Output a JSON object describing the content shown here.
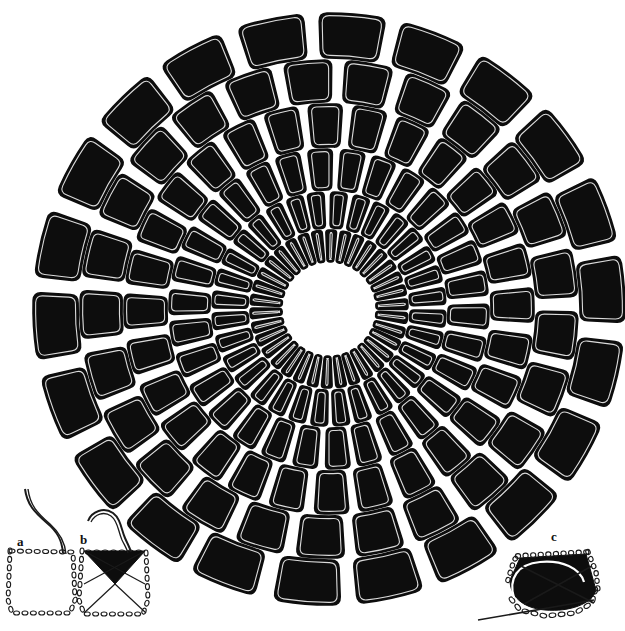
{
  "figure": {
    "kind": "scientific-plate",
    "caption_labels": [
      "a",
      "b",
      "c"
    ],
    "background_color": "#ffffff",
    "ink_color": "#0d0d0d",
    "outline_color": "#1a1a1a"
  },
  "comb": {
    "name": "radial-spiral-comb",
    "center_x": 329,
    "center_y": 309,
    "outer_radius": 296,
    "hub_radius": 46,
    "hub_color": "#ffffff",
    "cell_fill": "#0d0d0d",
    "cell_stroke": "#ffffff",
    "spiral_twist_deg": 26,
    "rings": [
      {
        "index": 0,
        "inner_r": 47,
        "outer_r": 79,
        "count": 34,
        "corner": 3,
        "gap_deg": 2.6,
        "phase_deg": 0
      },
      {
        "index": 1,
        "inner_r": 81,
        "outer_r": 117,
        "count": 32,
        "corner": 4,
        "gap_deg": 2.8,
        "phase_deg": 5
      },
      {
        "index": 2,
        "inner_r": 119,
        "outer_r": 160,
        "count": 30,
        "corner": 5,
        "gap_deg": 3.0,
        "phase_deg": 11
      },
      {
        "index": 3,
        "inner_r": 162,
        "outer_r": 205,
        "count": 28,
        "corner": 6,
        "gap_deg": 3.1,
        "phase_deg": 17
      },
      {
        "index": 4,
        "inner_r": 207,
        "outer_r": 249,
        "count": 25,
        "corner": 7,
        "gap_deg": 3.2,
        "phase_deg": 23
      },
      {
        "index": 5,
        "inner_r": 251,
        "outer_r": 296,
        "count": 22,
        "corner": 8,
        "gap_deg": 3.3,
        "phase_deg": 30
      }
    ]
  },
  "insets": [
    {
      "id": "a",
      "label": "a",
      "label_x": 17,
      "label_y": 546,
      "description": "empty cell outline in beaded dotted line with a single curved fibre drawn down from above",
      "outline_style": "beaded-dotted",
      "has_fill": false,
      "has_cross_lines": false
    },
    {
      "id": "b",
      "label": "b",
      "label_x": 80,
      "label_y": 544,
      "description": "cell outline in beaded dotted line with solid filled inverted triangle at top and two crossing guide lines",
      "outline_style": "beaded-dotted",
      "has_fill": true,
      "has_cross_lines": true
    },
    {
      "id": "c",
      "label": "c",
      "label_x": 551,
      "label_y": 541,
      "description": "oblique view of finished cell, solid filled dome with beaded rim, dashed base outline and two crossing guide lines with a straight pointer",
      "outline_style": "beaded-dotted",
      "has_fill": true,
      "has_cross_lines": true
    }
  ]
}
